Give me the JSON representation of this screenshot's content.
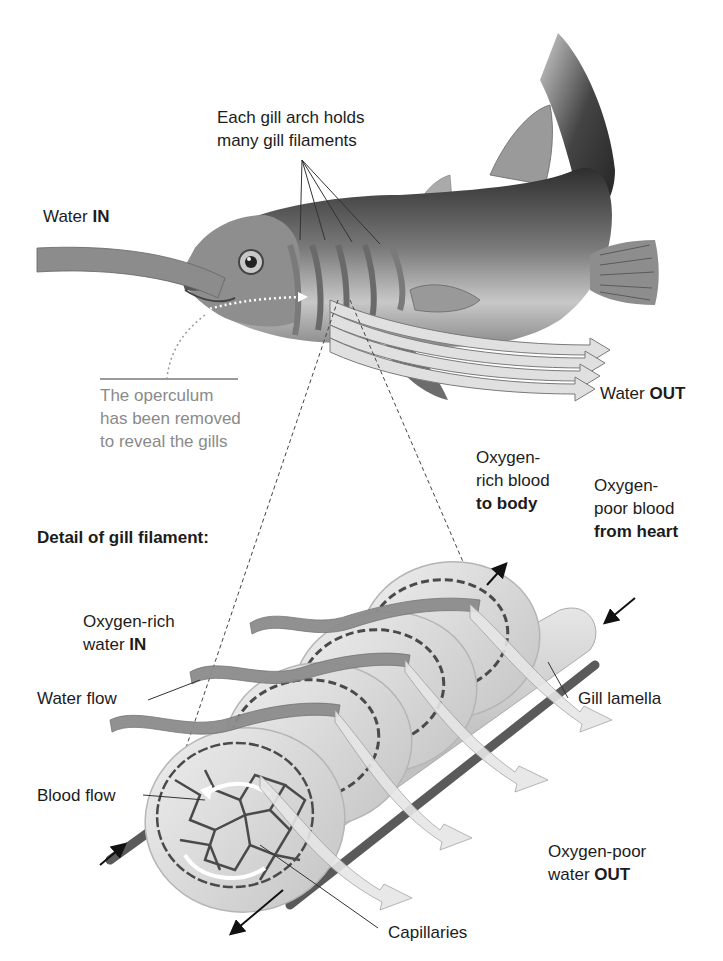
{
  "diagram": {
    "type": "fish gill anatomy",
    "palette": {
      "background": "#ffffff",
      "text": "#1c1c1c",
      "annotation_grey": "#8a8a8a",
      "water_band": "#8c8c8c",
      "water_out_band": "#dcdcdc",
      "lamella": "#d9d9d9",
      "capillaries": "#4a4a4a",
      "blood_vessel": "#5a5a5a",
      "fish_body_dark": "#3a3a3a",
      "fish_body_light": "#bdbdbd"
    }
  },
  "labels": {
    "gill_arch": {
      "line1": "Each gill arch holds",
      "line2": "many gill filaments"
    },
    "water_in": {
      "text": "Water ",
      "bold": "IN"
    },
    "water_out": {
      "text": "Water ",
      "bold": "OUT"
    },
    "operculum": {
      "line1": "The operculum",
      "line2": "has been removed",
      "line3": "to reveal the gills"
    },
    "detail_title": "Detail of gill filament:",
    "o2_rich_blood": {
      "line1": "Oxygen-",
      "line2": "rich blood",
      "bold": "to body"
    },
    "o2_poor_blood": {
      "line1": "Oxygen-",
      "line2": "poor blood",
      "bold": "from heart"
    },
    "o2_rich_water": {
      "line1": "Oxygen-rich",
      "text": "water ",
      "bold": "IN"
    },
    "water_flow": "Water flow",
    "gill_lamella": "Gill lamella",
    "blood_flow": "Blood flow",
    "o2_poor_water": {
      "line1": "Oxygen-poor",
      "text": "water ",
      "bold": "OUT"
    },
    "capillaries": "Capillaries"
  }
}
